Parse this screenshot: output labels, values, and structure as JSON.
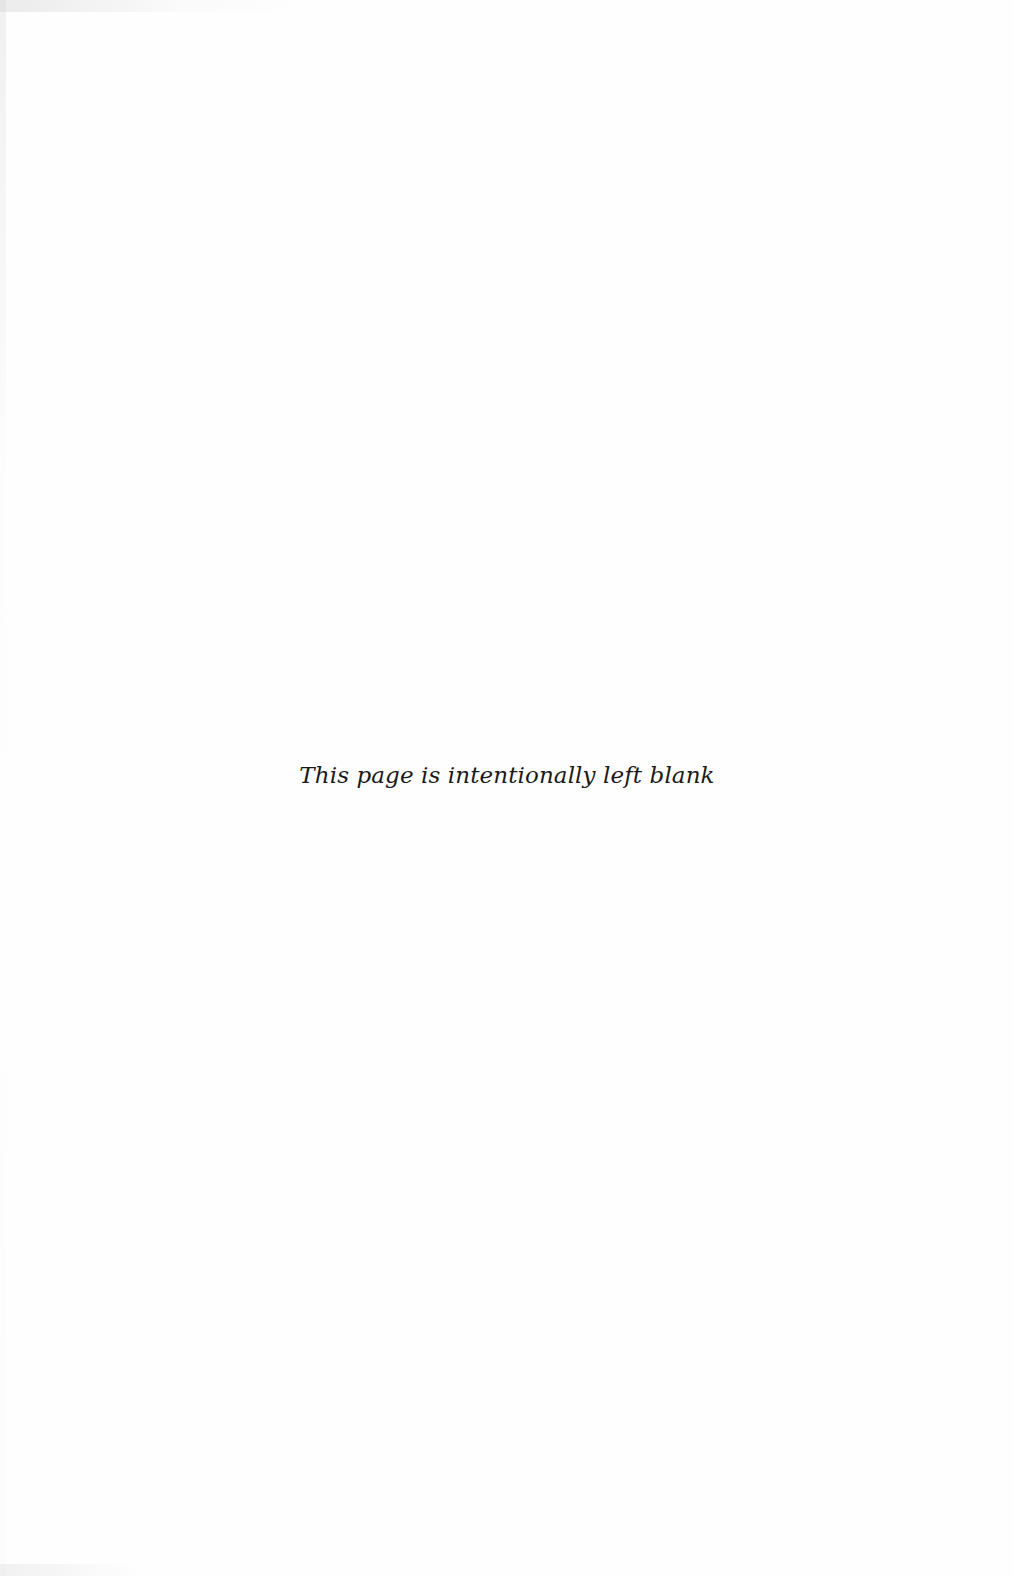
{
  "page": {
    "notice": "This page is intentionally left blank",
    "background_color": "#fefefe",
    "text_color": "#1a1a1a"
  }
}
